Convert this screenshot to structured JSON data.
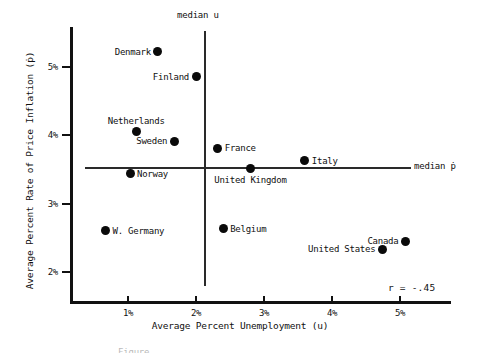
{
  "figure": {
    "axis_titles": {
      "x": "Average Percent Unemployment (u)",
      "y": "Average Percent Rate of Price Inflation (ṗ)"
    },
    "annotation": "r = -.45",
    "median_u_label": "median u",
    "median_p_label": "median ṗ",
    "caption_partial": "Figure"
  },
  "chart_data": {
    "type": "scatter",
    "title": "",
    "xlabel": "Average Percent Unemployment (u)",
    "ylabel": "Average Percent Rate of Price Inflation (ṗ)",
    "xlim": [
      0.2,
      5.6
    ],
    "ylim": [
      1.55,
      5.6
    ],
    "xticks": [
      "1%",
      "2%",
      "3%",
      "4%",
      "5%"
    ],
    "xtick_values": [
      1,
      2,
      3,
      4,
      5
    ],
    "yticks": [
      "2%",
      "3%",
      "4%",
      "5%"
    ],
    "ytick_values": [
      2,
      3,
      4,
      5
    ],
    "grid": false,
    "legend": "none",
    "correlation": -0.45,
    "correlation_label": "r = -.45",
    "reference_lines": [
      {
        "name": "median u",
        "orientation": "vertical",
        "value": 2.12,
        "label": "median u"
      },
      {
        "name": "median ṗ",
        "orientation": "horizontal",
        "value": 3.52,
        "label": "median ṗ"
      }
    ],
    "points": [
      {
        "label": "Denmark",
        "u": 1.44,
        "p": 5.22,
        "label_pos": "left"
      },
      {
        "label": "Finland",
        "u": 2.0,
        "p": 4.86,
        "label_pos": "left"
      },
      {
        "label": "Netherlands",
        "u": 1.12,
        "p": 4.05,
        "label_pos": "above"
      },
      {
        "label": "Sweden",
        "u": 1.68,
        "p": 3.91,
        "label_pos": "left"
      },
      {
        "label": "Norway",
        "u": 1.03,
        "p": 3.44,
        "label_pos": "right"
      },
      {
        "label": "France",
        "u": 2.32,
        "p": 3.81,
        "label_pos": "right"
      },
      {
        "label": "Italy",
        "u": 3.6,
        "p": 3.63,
        "label_pos": "right"
      },
      {
        "label": "United Kingdom",
        "u": 2.8,
        "p": 3.51,
        "label_pos": "below"
      },
      {
        "label": "W. Germany",
        "u": 0.67,
        "p": 2.6,
        "label_pos": "right"
      },
      {
        "label": "Belgium",
        "u": 2.4,
        "p": 2.63,
        "label_pos": "right"
      },
      {
        "label": "Canada",
        "u": 5.08,
        "p": 2.45,
        "label_pos": "left"
      },
      {
        "label": "United States",
        "u": 4.74,
        "p": 2.33,
        "label_pos": "left"
      }
    ]
  }
}
